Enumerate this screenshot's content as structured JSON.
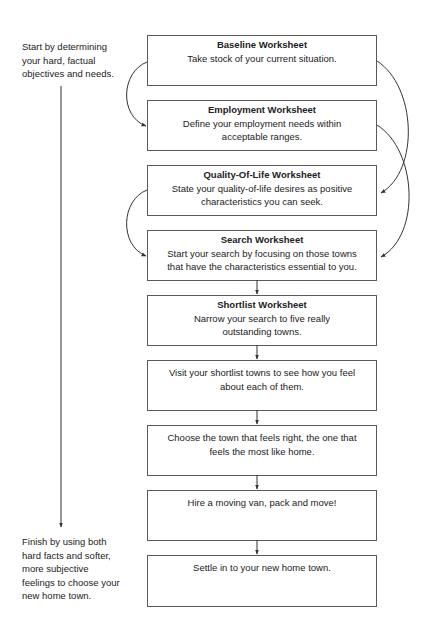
{
  "side_notes": {
    "start": "Start by determining\nyour hard, factual\nobjectives and needs.",
    "finish": "Finish by using both\nhard facts and softer,\nmore subjective\nfeelings to choose your\nnew home town."
  },
  "steps": [
    {
      "title": "Baseline Worksheet",
      "text": "Take stock of your current situation."
    },
    {
      "title": "Employment Worksheet",
      "text": "Define your employment needs within\nacceptable ranges."
    },
    {
      "title": "Quality-Of-Life Worksheet",
      "text": "State your quality-of-life desires as positive\ncharacteristics you can seek."
    },
    {
      "title": "Search Worksheet",
      "text": "Start your search by focusing on those towns\nthat have the characteristics essential to you."
    },
    {
      "title": "Shortlist Worksheet",
      "text": "Narrow your search to five really\noutstanding towns."
    },
    {
      "text": "Visit your shortlist towns to see how you feel\nabout each of them."
    },
    {
      "text": "Choose the town that feels right, the one that\nfeels the most like home."
    },
    {
      "text": "Hire a moving van, pack and move!"
    },
    {
      "text": "Settle in to your new home town."
    }
  ],
  "colors": {
    "line": "#333333",
    "border": "#5a5a5a",
    "text": "#222222"
  }
}
